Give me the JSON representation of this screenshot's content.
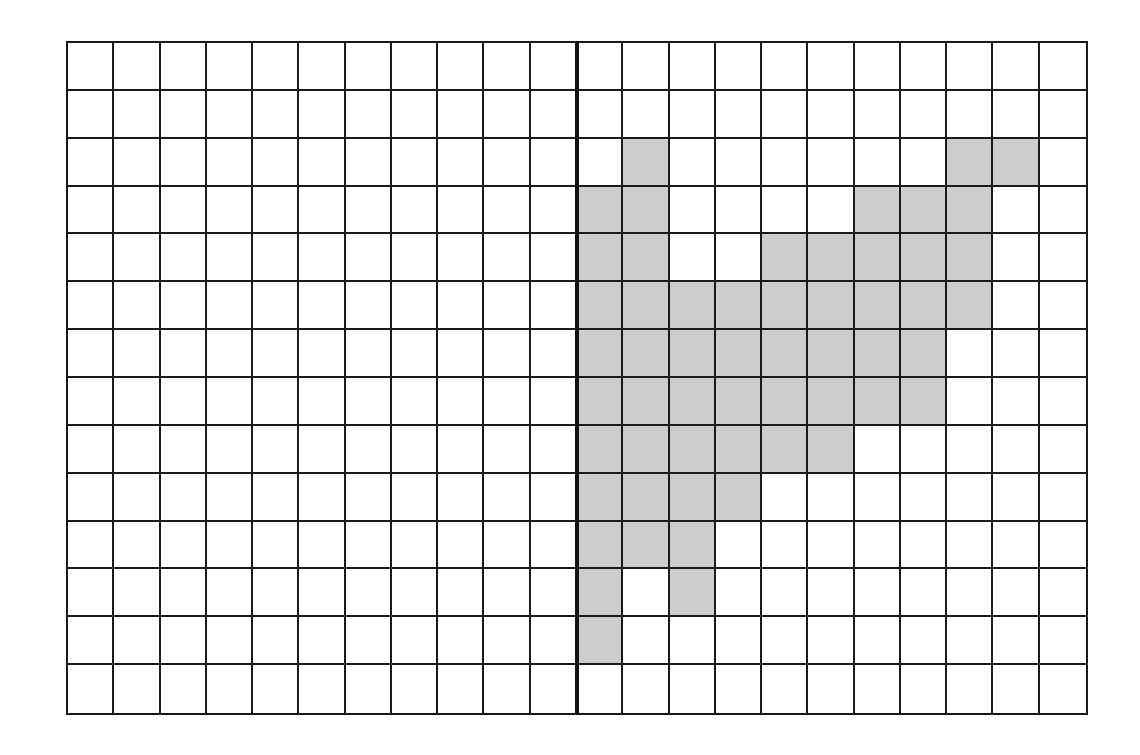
{
  "diagram": {
    "type": "grid",
    "rows": 14,
    "cols": 22,
    "divider_after_col": 11,
    "colors": {
      "line": "#1a1a1a",
      "divider": "#111111",
      "empty": "#ffffff",
      "shaded": "#cdcdcd"
    },
    "shaded_cells": [
      [
        2,
        12
      ],
      [
        2,
        19
      ],
      [
        2,
        20
      ],
      [
        3,
        11
      ],
      [
        3,
        12
      ],
      [
        3,
        17
      ],
      [
        3,
        18
      ],
      [
        3,
        19
      ],
      [
        4,
        11
      ],
      [
        4,
        12
      ],
      [
        4,
        15
      ],
      [
        4,
        16
      ],
      [
        4,
        17
      ],
      [
        4,
        18
      ],
      [
        4,
        19
      ],
      [
        5,
        11
      ],
      [
        5,
        12
      ],
      [
        5,
        13
      ],
      [
        5,
        14
      ],
      [
        5,
        15
      ],
      [
        5,
        16
      ],
      [
        5,
        17
      ],
      [
        5,
        18
      ],
      [
        5,
        19
      ],
      [
        6,
        11
      ],
      [
        6,
        12
      ],
      [
        6,
        13
      ],
      [
        6,
        14
      ],
      [
        6,
        15
      ],
      [
        6,
        16
      ],
      [
        6,
        17
      ],
      [
        6,
        18
      ],
      [
        7,
        11
      ],
      [
        7,
        12
      ],
      [
        7,
        13
      ],
      [
        7,
        14
      ],
      [
        7,
        15
      ],
      [
        7,
        16
      ],
      [
        7,
        17
      ],
      [
        7,
        18
      ],
      [
        8,
        11
      ],
      [
        8,
        12
      ],
      [
        8,
        13
      ],
      [
        8,
        14
      ],
      [
        8,
        15
      ],
      [
        8,
        16
      ],
      [
        9,
        11
      ],
      [
        9,
        12
      ],
      [
        9,
        13
      ],
      [
        9,
        14
      ],
      [
        10,
        11
      ],
      [
        10,
        12
      ],
      [
        10,
        13
      ],
      [
        11,
        11
      ],
      [
        11,
        13
      ],
      [
        12,
        11
      ]
    ]
  }
}
